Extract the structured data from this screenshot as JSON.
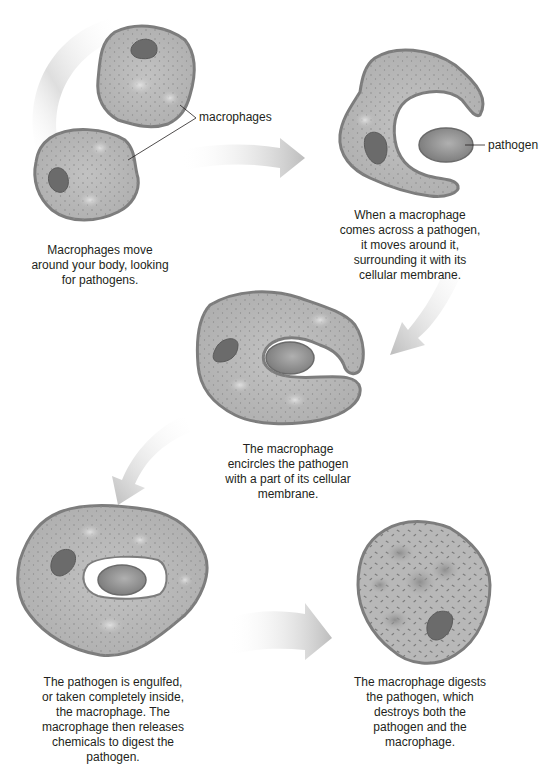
{
  "diagram": {
    "labels": {
      "macrophages": "macrophages",
      "pathogen": "pathogen"
    },
    "steps": [
      {
        "id": 1,
        "caption": "Macrophages move around your body, looking for pathogens."
      },
      {
        "id": 2,
        "caption": "When a macrophage comes across a pathogen, it moves around it, surrounding it with its cellular membrane."
      },
      {
        "id": 3,
        "caption": "The macrophage encircles the pathogen with a part of its cellular membrane."
      },
      {
        "id": 4,
        "caption": "The pathogen is engulfed, or taken completely inside, the macrophage. The macrophage then releases chemicals to digest the pathogen."
      },
      {
        "id": 5,
        "caption": "The macrophage digests the pathogen, which destroys both the pathogen and the macrophage."
      }
    ],
    "colors": {
      "cytoplasm": "#b3b3b3",
      "membrane": "#7d7d7d",
      "nucleus": "#6b6b6b",
      "pathogen": "#8e8e8e",
      "arrow": "#c9c9c9",
      "text": "#231f20"
    }
  }
}
